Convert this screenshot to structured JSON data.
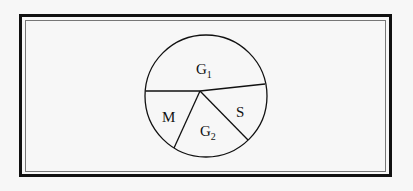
{
  "diagram": {
    "type": "pie-partition",
    "regions": [
      {
        "id": "G1",
        "label": "G",
        "subscript": "1"
      },
      {
        "id": "S",
        "label": "S",
        "subscript": ""
      },
      {
        "id": "G2",
        "label": "G",
        "subscript": "2"
      },
      {
        "id": "M",
        "label": "M",
        "subscript": ""
      }
    ],
    "colors": {
      "stroke": "#111111",
      "background": "#f7f7f7",
      "frame": "#111111",
      "inner_frame": "#777777"
    }
  }
}
